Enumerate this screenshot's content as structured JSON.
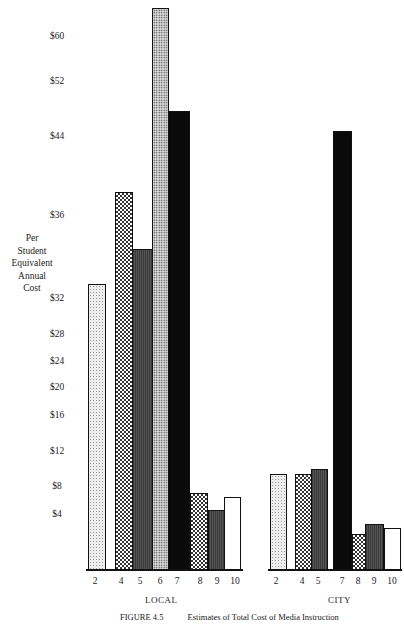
{
  "chart_data": {
    "type": "bar",
    "title": "Estimates of Total Cost of Media Instruction",
    "figure_label": "FIGURE 4.5",
    "ylabel": "Per Student Equivalent Annual Cost",
    "xlabel": "",
    "y_ticks": [
      "$60",
      "$52",
      "$44",
      "$36",
      "$32",
      "$28",
      "$24",
      "$20",
      "$16",
      "$12",
      "$8",
      "$4"
    ],
    "y_axis_note": "non-linear scale",
    "groups": [
      {
        "name": "LOCAL",
        "categories": [
          "2",
          "4",
          "5",
          "6",
          "7",
          "8",
          "9",
          "10"
        ],
        "values": [
          32.7,
          38.4,
          34.4,
          65,
          47.8,
          7.1,
          4.7,
          6.4
        ]
      },
      {
        "name": "CITY",
        "categories": [
          "2",
          "4",
          "5",
          "7",
          "8",
          "9",
          "10"
        ],
        "values": [
          9.5,
          9.5,
          10.1,
          44.9,
          2.6,
          3.3,
          3.1
        ]
      }
    ],
    "grid": false,
    "legend": "none"
  },
  "axis": {
    "ylabel_lines": [
      "Per",
      "Student",
      "Equivalent",
      "Annual",
      "Cost"
    ],
    "ticks": [
      {
        "label": "$60",
        "y": 37
      },
      {
        "label": "$52",
        "y": 82
      },
      {
        "label": "$44",
        "y": 137
      },
      {
        "label": "$36",
        "y": 216
      },
      {
        "label": "$32",
        "y": 299
      },
      {
        "label": "$28",
        "y": 335
      },
      {
        "label": "$24",
        "y": 362
      },
      {
        "label": "$20",
        "y": 388
      },
      {
        "label": "$16",
        "y": 416
      },
      {
        "label": "$12",
        "y": 452
      },
      {
        "label": "$8",
        "y": 487
      },
      {
        "label": "$4",
        "y": 515
      }
    ]
  },
  "bars": [
    {
      "group": "LOCAL",
      "cat": "2",
      "x": 88,
      "w": 18,
      "top": 284,
      "pattern": "p-light"
    },
    {
      "group": "LOCAL",
      "cat": "4",
      "x": 115,
      "w": 18,
      "top": 192,
      "pattern": "p-check"
    },
    {
      "group": "LOCAL",
      "cat": "5",
      "x": 132,
      "w": 21,
      "top": 249,
      "pattern": "p-dark"
    },
    {
      "group": "LOCAL",
      "cat": "6",
      "x": 152,
      "w": 17,
      "top": 8,
      "pattern": "p-dotted"
    },
    {
      "group": "LOCAL",
      "cat": "7",
      "x": 168,
      "w": 22,
      "top": 111,
      "pattern": "p-black"
    },
    {
      "group": "LOCAL",
      "cat": "8",
      "x": 190,
      "w": 18,
      "top": 493,
      "pattern": "p-check"
    },
    {
      "group": "LOCAL",
      "cat": "9",
      "x": 208,
      "w": 17,
      "top": 510,
      "pattern": "p-dark"
    },
    {
      "group": "LOCAL",
      "cat": "10",
      "x": 224,
      "w": 17,
      "top": 497,
      "pattern": "p-white"
    },
    {
      "group": "CITY",
      "cat": "2",
      "x": 270,
      "w": 17,
      "top": 474,
      "pattern": "p-light"
    },
    {
      "group": "CITY",
      "cat": "4",
      "x": 295,
      "w": 17,
      "top": 474,
      "pattern": "p-check"
    },
    {
      "group": "CITY",
      "cat": "5",
      "x": 311,
      "w": 17,
      "top": 469,
      "pattern": "p-dark"
    },
    {
      "group": "CITY",
      "cat": "7",
      "x": 333,
      "w": 19,
      "top": 131,
      "pattern": "p-black"
    },
    {
      "group": "CITY",
      "cat": "8",
      "x": 352,
      "w": 14,
      "top": 534,
      "pattern": "p-check"
    },
    {
      "group": "CITY",
      "cat": "9",
      "x": 365,
      "w": 19,
      "top": 524,
      "pattern": "p-dark"
    },
    {
      "group": "CITY",
      "cat": "10",
      "x": 384,
      "w": 17,
      "top": 528,
      "pattern": "p-white"
    }
  ],
  "xticks": [
    {
      "label": "2",
      "x": 87
    },
    {
      "label": "4",
      "x": 113
    },
    {
      "label": "5",
      "x": 132
    },
    {
      "label": "6",
      "x": 152
    },
    {
      "label": "7",
      "x": 169
    },
    {
      "label": "8",
      "x": 192
    },
    {
      "label": "9",
      "x": 209
    },
    {
      "label": "10",
      "x": 227
    },
    {
      "label": "2",
      "x": 268
    },
    {
      "label": "4",
      "x": 294
    },
    {
      "label": "5",
      "x": 310
    },
    {
      "label": "7",
      "x": 334
    },
    {
      "label": "8",
      "x": 350
    },
    {
      "label": "9",
      "x": 366
    },
    {
      "label": "10",
      "x": 384
    }
  ],
  "group_labels": {
    "local": "LOCAL",
    "city": "CITY"
  },
  "caption": {
    "number": "FIGURE 4.5",
    "text": "Estimates of Total Cost of Media Instruction"
  }
}
